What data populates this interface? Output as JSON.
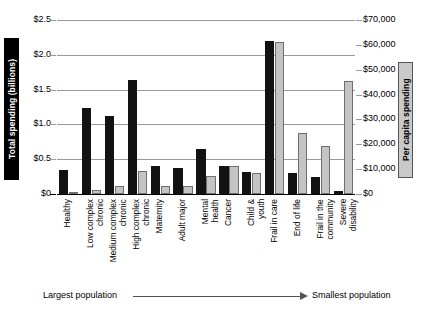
{
  "chart_data": {
    "type": "bar",
    "title": "",
    "xlabel": "",
    "ylabel": "Total spending (billions)",
    "y2label": "Per capita spending",
    "grid": true,
    "legend": "none",
    "orientation": "vertical",
    "grouping": "grouped",
    "categories": [
      "Healthy",
      "Low complex chronic",
      "Medium complex chronic",
      "High complex chronic",
      "Maternity",
      "Adult major",
      "Mental health",
      "Cancer",
      "Child & youth",
      "Frail in care",
      "End of life",
      "Frail in the community",
      "Severe disability"
    ],
    "category_lines": [
      [
        "Healthy"
      ],
      [
        "Low complex",
        "chronic"
      ],
      [
        "Medium complex",
        "chronic"
      ],
      [
        "High complex",
        "chronic"
      ],
      [
        "Maternity"
      ],
      [
        "Adult major"
      ],
      [
        "Mental",
        "health"
      ],
      [
        "Cancer"
      ],
      [
        "Child &",
        "youth"
      ],
      [
        "Frail in care"
      ],
      [
        "End of life"
      ],
      [
        "Frail in the",
        "community"
      ],
      [
        "Severe",
        "disability"
      ]
    ],
    "series": [
      {
        "name": "Total spending (billions)",
        "axis": "left",
        "color": "#121212",
        "values": [
          0.35,
          1.23,
          1.12,
          1.64,
          0.4,
          0.38,
          0.65,
          0.4,
          0.31,
          2.2,
          0.3,
          0.25,
          0.05
        ]
      },
      {
        "name": "Per capita spending",
        "axis": "right",
        "color": "#c4c4c4",
        "values": [
          800,
          1800,
          3200,
          9300,
          3400,
          3300,
          7200,
          11300,
          8600,
          61000,
          24500,
          19500,
          45500
        ]
      }
    ],
    "y_left": {
      "label": "Total spending (billions)",
      "min": 0,
      "max": 2.5,
      "ticks": [
        0,
        0.5,
        1.0,
        1.5,
        2.0,
        2.5
      ],
      "tick_labels": [
        "$0",
        "$0.5",
        "$1.0",
        "$1.5",
        "$2.0",
        "$2.5"
      ]
    },
    "y_right": {
      "label": "Per capita spending",
      "min": 0,
      "max": 70000,
      "ticks": [
        0,
        10000,
        20000,
        30000,
        40000,
        50000,
        60000,
        70000
      ],
      "tick_labels": [
        "$0",
        "$10,000",
        "$20,000",
        "$30,000",
        "$40,000",
        "$50,000",
        "$60,000",
        "$70,000"
      ]
    },
    "annotation": {
      "left_text": "Largest population",
      "right_text": "Smallest population"
    }
  }
}
